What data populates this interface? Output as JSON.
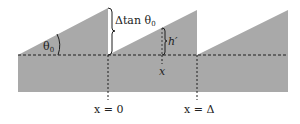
{
  "diagram": {
    "colors": {
      "fill": "#a9a9a9",
      "line": "#1e1e1e",
      "background": "#ffffff"
    },
    "labels": {
      "angle": "θ",
      "angle_sub": "0",
      "step_height": "Δtan θ",
      "step_height_sub": "0",
      "local_height": "h′",
      "local_x": "x",
      "origin": "x = 0",
      "period": "x = Δ"
    }
  }
}
